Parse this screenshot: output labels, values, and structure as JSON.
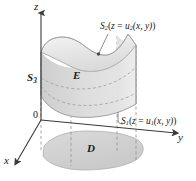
{
  "figure": {
    "name": "solid-region-E-between-two-surfaces",
    "background_color": "#ffffff",
    "axes": {
      "z_label": "z",
      "y_label": "y",
      "x_label": "x",
      "origin_label": "0"
    },
    "labels": {
      "solid_region": "E",
      "projection_region": "D",
      "lateral_surface": "S",
      "lateral_surface_sub": "3",
      "top_surface": "S",
      "top_surface_sub": "2",
      "top_surface_eq_open": "(",
      "top_surface_eq_var": "z",
      "top_surface_eq_sign": " = ",
      "top_surface_eq_fn": "u",
      "top_surface_eq_fn_sub": "2",
      "top_surface_eq_args": "(x, y)",
      "top_surface_eq_close": ")",
      "bottom_surface": "S",
      "bottom_surface_sub": "1",
      "bottom_surface_eq_open": "(",
      "bottom_surface_eq_var": "z",
      "bottom_surface_eq_sign": " = ",
      "bottom_surface_eq_fn": "u",
      "bottom_surface_eq_fn_sub": "1",
      "bottom_surface_eq_args": "(x, y)",
      "bottom_surface_eq_close": ")"
    },
    "colors": {
      "axis_line": "#3a3a3a",
      "dashed_line": "#8f8f8f",
      "outline": "#9a9a9a",
      "solid_left_face": "#c8c8c8",
      "solid_front_face": "#d8d8d8",
      "solid_right_face": "#e8e8e8",
      "solid_top_face": "#efefef",
      "solid_bottom_face": "#cdcdcd",
      "projection_region": "#d2d2d2",
      "text": "#1a1a1a"
    }
  }
}
